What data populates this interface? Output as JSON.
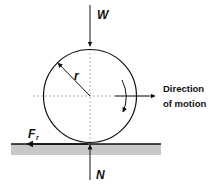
{
  "diagram": {
    "labels": {
      "weight": "W",
      "radius": "r",
      "normal": "N",
      "friction_main": "F",
      "friction_sub": "r",
      "direction_line1": "Direction",
      "direction_line2": "of motion"
    },
    "colors": {
      "stroke": "#111111",
      "ground": "#c8c8c8",
      "dashed": "#9a9a9a",
      "background": "#ffffff"
    }
  }
}
